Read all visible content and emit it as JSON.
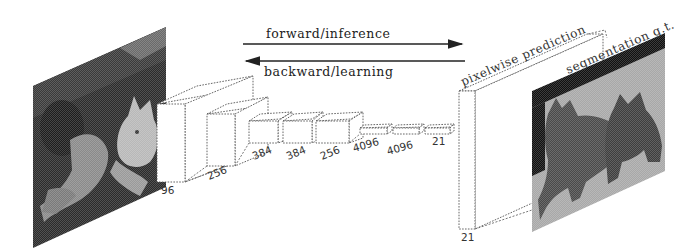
{
  "diagram": {
    "arrows": {
      "forward_label": "forward/inference",
      "backward_label": "backward/learning"
    },
    "input_image": {
      "description": "input photo: dog and cat",
      "icon": "photo-icon"
    },
    "layers": [
      {
        "channels": "96"
      },
      {
        "channels": "256"
      },
      {
        "channels": "384"
      },
      {
        "channels": "384"
      },
      {
        "channels": "256"
      },
      {
        "channels": "4096"
      },
      {
        "channels": "4096"
      },
      {
        "channels": "21"
      }
    ],
    "output": {
      "label": "pixelwise prediction",
      "channels": "21"
    },
    "ground_truth": {
      "label": "segmentation g.t.",
      "description": "segmentation mask: dog and cat silhouettes",
      "icon": "segmentation-mask-icon"
    },
    "colors": {
      "line": "#555555",
      "photo_dark": "#2a2a2a",
      "mask_bg": "#a8a8a8",
      "mask_fg": "#4a4a4a",
      "mask_border": "#111111"
    }
  }
}
